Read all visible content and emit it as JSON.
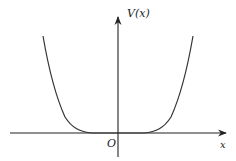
{
  "figure": {
    "type": "potential-well-sketch",
    "y_axis_label": "V(x)",
    "x_axis_label": "x",
    "origin_label": "O",
    "colors": {
      "axes": "#222222",
      "curve": "#333333",
      "background": "#ffffff"
    }
  },
  "geometry": {
    "origin": [
      118,
      133
    ],
    "x_axis": {
      "from": [
        10,
        133
      ],
      "to": [
        228,
        133
      ]
    },
    "y_axis": {
      "from": [
        118,
        157
      ],
      "to": [
        118,
        15
      ]
    },
    "curve_description": "symmetric even-power potential, flat near origin, rising steeply at both sides",
    "curve_points_left": [
      [
        43,
        36
      ],
      [
        50,
        70
      ],
      [
        57,
        98
      ],
      [
        65,
        117
      ],
      [
        75,
        128
      ],
      [
        88,
        132.5
      ],
      [
        100,
        133
      ]
    ],
    "curve_points_right": [
      [
        136,
        133
      ],
      [
        148,
        132.5
      ],
      [
        161,
        128
      ],
      [
        171,
        117
      ],
      [
        179,
        98
      ],
      [
        186,
        70
      ],
      [
        193,
        36
      ]
    ]
  }
}
